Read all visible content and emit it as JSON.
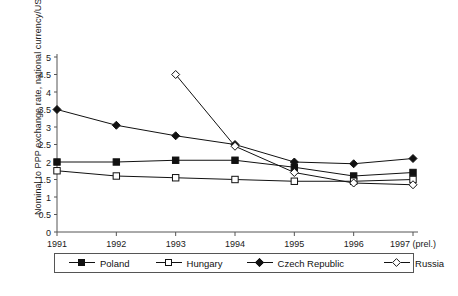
{
  "chart_data": {
    "type": "line",
    "title": "",
    "xlabel": "",
    "ylabel": "Nominal to PPP exchange rate, national currency/USD",
    "x": [
      "1991",
      "1992",
      "1993",
      "1994",
      "1995",
      "1996",
      "1997 (prel.)"
    ],
    "xtick_labels": [
      "1991",
      "1992",
      "1993",
      "1994",
      "1995",
      "1996",
      "1997 (prel.)"
    ],
    "ytick_labels": [
      "0",
      "0.5",
      "1",
      "1.5",
      "2",
      "2.5",
      "3",
      "3.5",
      "4",
      "4.5",
      "5"
    ],
    "ylim": [
      0,
      5
    ],
    "ytick_step": 0.5,
    "grid": false,
    "legend_position": "bottom",
    "series": [
      {
        "name": "Poland",
        "marker": "square-filled",
        "color": "#111111",
        "x": [
          "1991",
          "1992",
          "1993",
          "1994",
          "1995",
          "1996",
          "1997 (prel.)"
        ],
        "values": [
          2.0,
          2.0,
          2.05,
          2.05,
          1.85,
          1.6,
          1.7
        ]
      },
      {
        "name": "Hungary",
        "marker": "square-open",
        "color": "#111111",
        "x": [
          "1991",
          "1992",
          "1993",
          "1994",
          "1995",
          "1996",
          "1997 (prel.)"
        ],
        "values": [
          1.75,
          1.6,
          1.55,
          1.5,
          1.45,
          1.45,
          1.5
        ]
      },
      {
        "name": "Czech Republic",
        "marker": "diamond-filled",
        "color": "#111111",
        "x": [
          "1991",
          "1992",
          "1993",
          "1994",
          "1995",
          "1996",
          "1997 (prel.)"
        ],
        "values": [
          3.5,
          3.05,
          2.75,
          2.5,
          2.0,
          1.95,
          2.1
        ]
      },
      {
        "name": "Russia",
        "marker": "diamond-open",
        "color": "#111111",
        "x": [
          "1993",
          "1994",
          "1995",
          "1996",
          "1997 (prel.)"
        ],
        "values": [
          4.5,
          2.45,
          1.7,
          1.4,
          1.35
        ]
      }
    ]
  },
  "legend": {
    "entries": [
      {
        "label": "Poland",
        "marker": "square-filled"
      },
      {
        "label": "Hungary",
        "marker": "square-open"
      },
      {
        "label": "Czech Republic",
        "marker": "diamond-filled"
      },
      {
        "label": "Russia",
        "marker": "diamond-open"
      }
    ]
  },
  "axes": {
    "y_title": "Nominal to PPP exchange rate, national currency/USD"
  }
}
